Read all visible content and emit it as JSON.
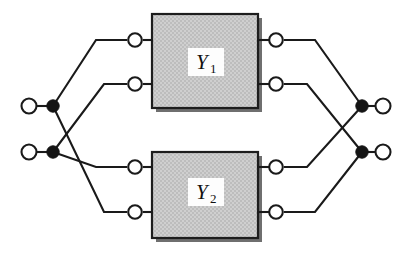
{
  "figure": {
    "type": "circuit-diagram",
    "width": 412,
    "height": 260,
    "background_color": "#ffffff",
    "wire_color": "#1a1a1a",
    "box_fill_color": "#c9c9c9",
    "box_border_color": "#1d1d1d",
    "box_shadow_color": "#6f6f6f",
    "terminal_fill_color": "#ffffff",
    "junction_color": "#141414"
  },
  "networks": [
    {
      "id": "Y1",
      "label_base": "Y",
      "label_sub": "1",
      "box": {
        "x": 152,
        "y": 14,
        "width": 106,
        "height": 94
      },
      "label_plate": {
        "x": 188,
        "y": 48,
        "width": 36,
        "height": 28
      },
      "ports": [
        {
          "name": "y1-left-port-top",
          "cx": 135,
          "cy": 40
        },
        {
          "name": "y1-left-port-bottom",
          "cx": 135,
          "cy": 84
        },
        {
          "name": "y1-right-port-top",
          "cx": 276,
          "cy": 40
        },
        {
          "name": "y1-right-port-bottom",
          "cx": 276,
          "cy": 84
        }
      ]
    },
    {
      "id": "Y2",
      "label_base": "Y",
      "label_sub": "2",
      "box": {
        "x": 152,
        "y": 152,
        "width": 106,
        "height": 86
      },
      "label_plate": {
        "x": 188,
        "y": 178,
        "width": 36,
        "height": 28
      },
      "ports": [
        {
          "name": "y2-left-port-top",
          "cx": 135,
          "cy": 167
        },
        {
          "name": "y2-left-port-bottom",
          "cx": 135,
          "cy": 212
        },
        {
          "name": "y2-right-port-top",
          "cx": 276,
          "cy": 167
        },
        {
          "name": "y2-right-port-bottom",
          "cx": 276,
          "cy": 212
        }
      ]
    }
  ],
  "external_terminals": [
    {
      "name": "input-terminal-top",
      "cx": 29,
      "cy": 106,
      "side": "left"
    },
    {
      "name": "input-terminal-bottom",
      "cx": 29,
      "cy": 152,
      "side": "left"
    },
    {
      "name": "output-terminal-top",
      "cx": 383,
      "cy": 106,
      "side": "right"
    },
    {
      "name": "output-terminal-bottom",
      "cx": 383,
      "cy": 152,
      "side": "right"
    }
  ],
  "junctions": [
    {
      "name": "input-junction-top",
      "cx": 53,
      "cy": 106
    },
    {
      "name": "input-junction-bottom",
      "cx": 53,
      "cy": 152
    },
    {
      "name": "output-junction-top",
      "cx": 362,
      "cy": 106
    },
    {
      "name": "output-junction-bottom",
      "cx": 362,
      "cy": 152
    }
  ],
  "wires": {
    "input_leads": [
      {
        "name": "wire-input-top-lead",
        "d": "M 37 106 L 53 106"
      },
      {
        "name": "wire-input-bottom-lead",
        "d": "M 37 152 L 53 152"
      }
    ],
    "left_network": [
      {
        "name": "wire-in-top-to-y1-port1",
        "d": "M 53 106 L 96 40 L 127 40"
      },
      {
        "name": "wire-in-top-to-y2-port2",
        "d": "M 53 106 L 104 212 L 127 212"
      },
      {
        "name": "wire-in-bottom-to-y1-port2",
        "d": "M 53 152 L 104 84 L 127 84"
      },
      {
        "name": "wire-in-bottom-to-y2-port1",
        "d": "M 53 152 L 96 167 L 127 167"
      }
    ],
    "box_stubs": [
      {
        "name": "wire-y1-port1-stub",
        "d": "M 143 40 L 152 40"
      },
      {
        "name": "wire-y1-port2-stub",
        "d": "M 143 84 L 152 84"
      },
      {
        "name": "wire-y1-port3-stub",
        "d": "M 258 40 L 268 40"
      },
      {
        "name": "wire-y1-port4-stub",
        "d": "M 258 84 L 268 84"
      },
      {
        "name": "wire-y2-port1-stub",
        "d": "M 143 167 L 152 167"
      },
      {
        "name": "wire-y2-port2-stub",
        "d": "M 143 212 L 152 212"
      },
      {
        "name": "wire-y2-port3-stub",
        "d": "M 258 167 L 268 167"
      },
      {
        "name": "wire-y2-port4-stub",
        "d": "M 258 212 L 268 212"
      }
    ],
    "right_network": [
      {
        "name": "wire-y1-port3-to-out-top",
        "d": "M 284 40 L 315 40 L 362 106"
      },
      {
        "name": "wire-y1-port4-to-out-bottom",
        "d": "M 284 84 L 307 84 L 362 152"
      },
      {
        "name": "wire-y2-port3-to-out-top",
        "d": "M 284 167 L 307 167 L 362 106"
      },
      {
        "name": "wire-y2-port4-to-out-bottom",
        "d": "M 284 212 L 315 212 L 362 152"
      }
    ],
    "output_leads": [
      {
        "name": "wire-output-top-lead",
        "d": "M 362 106 L 375 106"
      },
      {
        "name": "wire-output-bottom-lead",
        "d": "M 362 152 L 375 152"
      }
    ]
  },
  "geometry": {
    "terminal_radius": 7.5,
    "port_radius": 6.8,
    "junction_radius": 6.2
  }
}
